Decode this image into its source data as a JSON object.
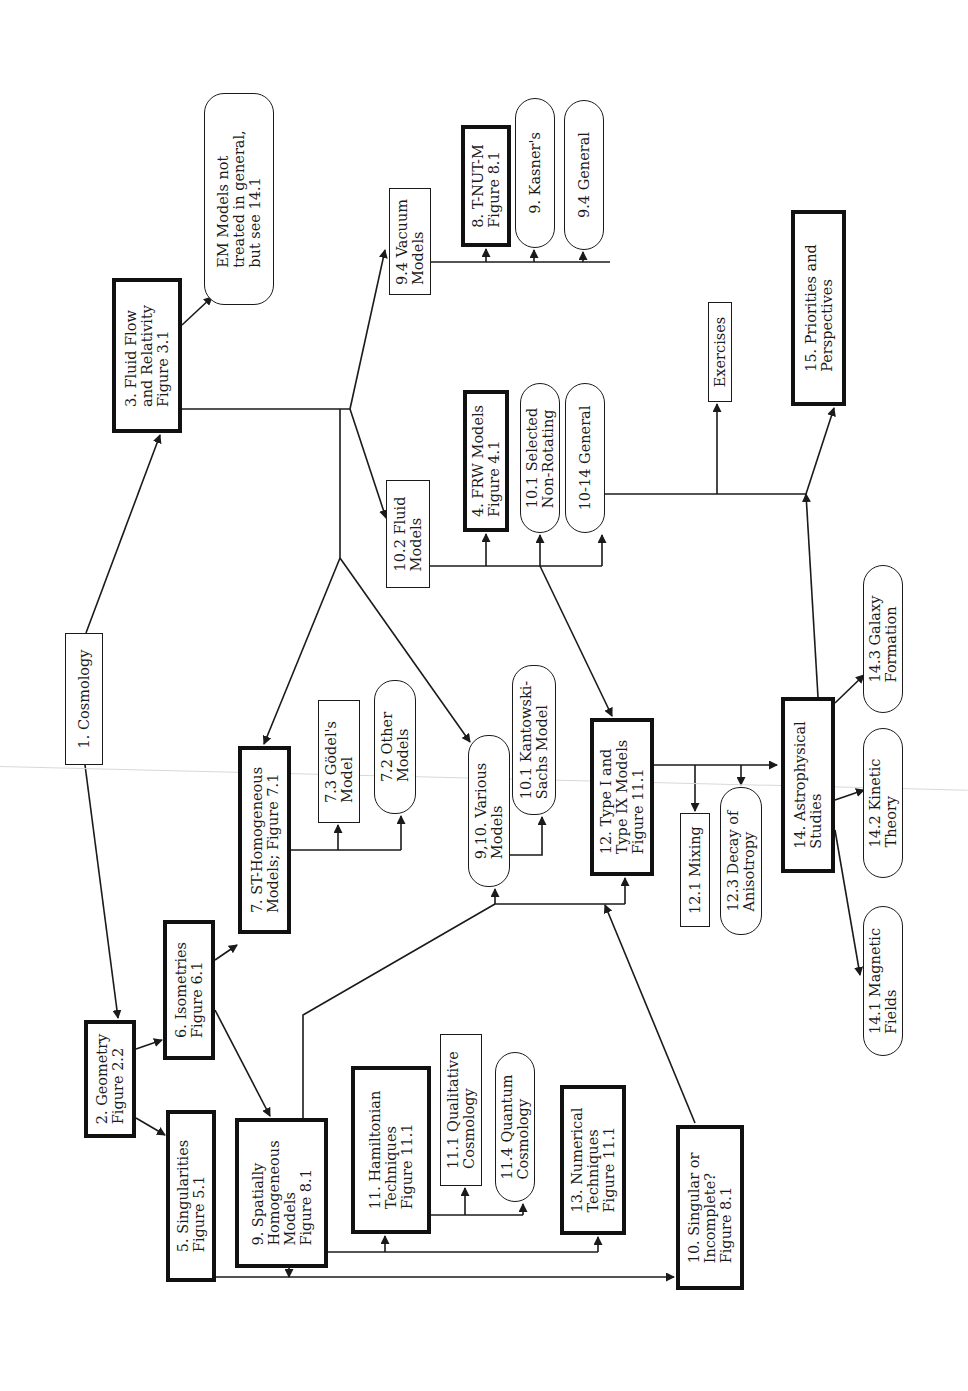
{
  "diagram": {
    "orientation": "rotated -90deg",
    "colors": {
      "ink": "#1a1a1a",
      "background": "#ffffff"
    },
    "nodes": [
      {
        "id": "n1",
        "style": "thin",
        "x": 65,
        "y": 633,
        "w": 38,
        "h": 132,
        "lines": [
          "1.  Cosmology"
        ]
      },
      {
        "id": "n2",
        "style": "thick",
        "x": 84,
        "y": 1020,
        "w": 52,
        "h": 118,
        "lines": [
          "2.  Geometry",
          "Figure 2.2"
        ]
      },
      {
        "id": "n3",
        "style": "thick",
        "x": 112,
        "y": 278,
        "w": 70,
        "h": 155,
        "lines": [
          "3.  Fluid Flow",
          "and Relativity",
          "Figure 3.1"
        ]
      },
      {
        "id": "nEM",
        "style": "rounded",
        "x": 204,
        "y": 93,
        "w": 70,
        "h": 212,
        "lines": [
          "EM Models not",
          "treated in general,",
          "but see 14.1"
        ]
      },
      {
        "id": "n5",
        "style": "thick",
        "x": 166,
        "y": 1110,
        "w": 50,
        "h": 172,
        "lines": [
          "5.  Singularities",
          "Figure 5.1"
        ]
      },
      {
        "id": "n6",
        "style": "thick",
        "x": 163,
        "y": 920,
        "w": 52,
        "h": 140,
        "lines": [
          "6.  Isometries",
          "Figure 6.1"
        ]
      },
      {
        "id": "n7",
        "style": "thick",
        "x": 238,
        "y": 746,
        "w": 53,
        "h": 188,
        "lines": [
          "7.  ST-Homogeneous",
          "Models; Figure 7.1"
        ]
      },
      {
        "id": "n7_3",
        "style": "thin",
        "x": 318,
        "y": 700,
        "w": 42,
        "h": 123,
        "lines": [
          "7.3 Gödel's",
          "Model"
        ]
      },
      {
        "id": "n7_2",
        "style": "rounded",
        "x": 374,
        "y": 680,
        "w": 42,
        "h": 134,
        "lines": [
          "7.2 Other",
          "Models"
        ]
      },
      {
        "id": "n9",
        "style": "thick",
        "x": 235,
        "y": 1118,
        "w": 93,
        "h": 150,
        "lines": [
          "9.  Spatially",
          "Homogeneous",
          "Models",
          "Figure 8.1"
        ]
      },
      {
        "id": "n9_4v",
        "style": "thin",
        "x": 389,
        "y": 188,
        "w": 42,
        "h": 107,
        "lines": [
          "9.4 Vacuum",
          "Models"
        ]
      },
      {
        "id": "n8",
        "style": "thick",
        "x": 461,
        "y": 125,
        "w": 50,
        "h": 122,
        "lines": [
          "8.  T-NUT-M",
          "Figure 8.1"
        ]
      },
      {
        "id": "n9k",
        "style": "rounded",
        "x": 515,
        "y": 98,
        "w": 40,
        "h": 150,
        "lines": [
          "9.  Kasner's"
        ]
      },
      {
        "id": "n9_4g",
        "style": "rounded",
        "x": 564,
        "y": 100,
        "w": 40,
        "h": 150,
        "lines": [
          "9.4 General"
        ]
      },
      {
        "id": "n10_2",
        "style": "thin",
        "x": 386,
        "y": 480,
        "w": 44,
        "h": 108,
        "lines": [
          "10.2 Fluid",
          "Models"
        ]
      },
      {
        "id": "n4",
        "style": "thick",
        "x": 463,
        "y": 390,
        "w": 46,
        "h": 142,
        "lines": [
          "4.  FRW Models",
          "Figure 4.1"
        ]
      },
      {
        "id": "n10_1s",
        "style": "rounded",
        "x": 520,
        "y": 383,
        "w": 40,
        "h": 150,
        "lines": [
          "10.1 Selected",
          "Non-Rotating"
        ]
      },
      {
        "id": "n10_14",
        "style": "rounded",
        "x": 565,
        "y": 383,
        "w": 40,
        "h": 150,
        "lines": [
          "10-14  General"
        ]
      },
      {
        "id": "nEx",
        "style": "thin",
        "x": 708,
        "y": 302,
        "w": 24,
        "h": 100,
        "lines": [
          "Exercises"
        ]
      },
      {
        "id": "n15",
        "style": "thick",
        "x": 791,
        "y": 210,
        "w": 55,
        "h": 196,
        "lines": [
          "15.  Priorities  and",
          "Perspectives"
        ]
      },
      {
        "id": "n9_10",
        "style": "rounded",
        "x": 468,
        "y": 735,
        "w": 42,
        "h": 152,
        "lines": [
          "9,10.  Various",
          "Models"
        ]
      },
      {
        "id": "n10_1k",
        "style": "rounded",
        "x": 512,
        "y": 665,
        "w": 44,
        "h": 150,
        "lines": [
          "10.1 Kantowski-",
          "Sachs Model"
        ]
      },
      {
        "id": "n12",
        "style": "thick",
        "x": 590,
        "y": 718,
        "w": 64,
        "h": 158,
        "lines": [
          "12.  Type I and",
          "Type IX Models",
          "Figure 11.1"
        ]
      },
      {
        "id": "n12_1",
        "style": "thin",
        "x": 680,
        "y": 813,
        "w": 30,
        "h": 114,
        "lines": [
          "12.1 Mixing"
        ]
      },
      {
        "id": "n12_3",
        "style": "rounded",
        "x": 720,
        "y": 787,
        "w": 42,
        "h": 148,
        "lines": [
          "12.3 Decay of",
          "Anisotropy"
        ]
      },
      {
        "id": "n14",
        "style": "thick",
        "x": 781,
        "y": 697,
        "w": 54,
        "h": 176,
        "lines": [
          "14.  Astrophysical",
          "Studies"
        ]
      },
      {
        "id": "n14_3",
        "style": "rounded",
        "x": 863,
        "y": 565,
        "w": 40,
        "h": 148,
        "lines": [
          "14.3 Galaxy",
          "Formation"
        ]
      },
      {
        "id": "n14_2",
        "style": "rounded",
        "x": 863,
        "y": 728,
        "w": 40,
        "h": 150,
        "lines": [
          "14.2 Kinetic",
          "Theory"
        ]
      },
      {
        "id": "n14_1",
        "style": "rounded",
        "x": 863,
        "y": 906,
        "w": 40,
        "h": 150,
        "lines": [
          "14.1 Magnetic",
          "Fields"
        ]
      },
      {
        "id": "n11",
        "style": "thick",
        "x": 351,
        "y": 1066,
        "w": 80,
        "h": 168,
        "lines": [
          "11.  Hamiltonian",
          "Techniques",
          "Figure 11.1"
        ]
      },
      {
        "id": "n11_1",
        "style": "thin",
        "x": 440,
        "y": 1034,
        "w": 42,
        "h": 152,
        "lines": [
          "11.1 Qualitative",
          "Cosmology"
        ]
      },
      {
        "id": "n11_4",
        "style": "rounded",
        "x": 495,
        "y": 1052,
        "w": 40,
        "h": 150,
        "lines": [
          "11.4 Quantum",
          "Cosmology"
        ]
      },
      {
        "id": "n13",
        "style": "thick",
        "x": 560,
        "y": 1085,
        "w": 66,
        "h": 150,
        "lines": [
          "13.  Numerical",
          "Techniques",
          "Figure 11.1"
        ]
      },
      {
        "id": "n10s",
        "style": "thick",
        "x": 676,
        "y": 1125,
        "w": 68,
        "h": 165,
        "lines": [
          "10.  Singular or",
          "Incomplete?",
          "Figure 8.1"
        ]
      }
    ],
    "edges": [
      {
        "points": [
          [
            86,
            633
          ],
          [
            160,
            435
          ]
        ],
        "arrow": true
      },
      {
        "points": [
          [
            85,
            765
          ],
          [
            118,
            1018
          ]
        ],
        "arrow": true
      },
      {
        "points": [
          [
            182,
            325
          ],
          [
            212,
            297
          ]
        ],
        "arrow": true
      },
      {
        "points": [
          [
            182,
            409
          ],
          [
            350,
            409
          ]
        ],
        "arrow": false
      },
      {
        "points": [
          [
            350,
            409
          ],
          [
            385,
            250
          ]
        ],
        "arrow": true
      },
      {
        "points": [
          [
            350,
            409
          ],
          [
            386,
            518
          ]
        ],
        "arrow": true
      },
      {
        "points": [
          [
            340,
            409
          ],
          [
            340,
            558
          ]
        ],
        "arrow": false
      },
      {
        "points": [
          [
            340,
            558
          ],
          [
            264,
            744
          ]
        ],
        "arrow": true
      },
      {
        "points": [
          [
            340,
            558
          ],
          [
            470,
            742
          ]
        ],
        "arrow": true
      },
      {
        "points": [
          [
            431,
            262
          ],
          [
            610,
            262
          ]
        ],
        "arrow": false
      },
      {
        "points": [
          [
            486,
            262
          ],
          [
            486,
            249
          ]
        ],
        "arrow": true
      },
      {
        "points": [
          [
            534,
            262
          ],
          [
            534,
            250
          ]
        ],
        "arrow": true
      },
      {
        "points": [
          [
            583,
            262
          ],
          [
            583,
            252
          ]
        ],
        "arrow": true
      },
      {
        "points": [
          [
            430,
            566
          ],
          [
            602,
            566
          ]
        ],
        "arrow": false
      },
      {
        "points": [
          [
            486,
            566
          ],
          [
            486,
            534
          ]
        ],
        "arrow": true
      },
      {
        "points": [
          [
            540,
            566
          ],
          [
            540,
            535
          ]
        ],
        "arrow": true
      },
      {
        "points": [
          [
            602,
            566
          ],
          [
            602,
            535
          ]
        ],
        "arrow": true
      },
      {
        "points": [
          [
            540,
            566
          ],
          [
            612,
            716
          ]
        ],
        "arrow": true
      },
      {
        "points": [
          [
            605,
            494
          ],
          [
            806,
            494
          ]
        ],
        "arrow": false
      },
      {
        "points": [
          [
            717,
            494
          ],
          [
            717,
            404
          ]
        ],
        "arrow": true
      },
      {
        "points": [
          [
            806,
            494
          ],
          [
            834,
            408
          ]
        ],
        "arrow": true
      },
      {
        "points": [
          [
            818,
            697
          ],
          [
            806,
            494
          ]
        ],
        "arrow": true
      },
      {
        "points": [
          [
            136,
            1049
          ],
          [
            162,
            1040
          ]
        ],
        "arrow": true
      },
      {
        "points": [
          [
            136,
            1118
          ],
          [
            165,
            1135
          ]
        ],
        "arrow": true
      },
      {
        "points": [
          [
            215,
            960
          ],
          [
            237,
            945
          ]
        ],
        "arrow": true
      },
      {
        "points": [
          [
            215,
            1010
          ],
          [
            270,
            1116
          ]
        ],
        "arrow": true
      },
      {
        "points": [
          [
            291,
            850
          ],
          [
            401,
            850
          ]
        ],
        "arrow": false
      },
      {
        "points": [
          [
            338,
            850
          ],
          [
            338,
            825
          ]
        ],
        "arrow": true
      },
      {
        "points": [
          [
            401,
            850
          ],
          [
            401,
            816
          ]
        ],
        "arrow": true
      },
      {
        "points": [
          [
            303,
            1118
          ],
          [
            303,
            1015
          ],
          [
            495,
            904
          ]
        ],
        "arrow": false
      },
      {
        "points": [
          [
            495,
            904
          ],
          [
            495,
            889
          ]
        ],
        "arrow": true
      },
      {
        "points": [
          [
            495,
            904
          ],
          [
            625,
            904
          ]
        ],
        "arrow": false
      },
      {
        "points": [
          [
            625,
            904
          ],
          [
            625,
            878
          ]
        ],
        "arrow": true
      },
      {
        "points": [
          [
            510,
            855
          ],
          [
            542,
            855
          ],
          [
            542,
            817
          ]
        ],
        "arrow": true
      },
      {
        "points": [
          [
            654,
            765
          ],
          [
            777,
            765
          ]
        ],
        "arrow": true
      },
      {
        "points": [
          [
            695,
            765
          ],
          [
            695,
            811
          ]
        ],
        "arrow": true
      },
      {
        "points": [
          [
            741,
            765
          ],
          [
            741,
            785
          ]
        ],
        "arrow": true
      },
      {
        "points": [
          [
            835,
            703
          ],
          [
            864,
            675
          ]
        ],
        "arrow": true
      },
      {
        "points": [
          [
            835,
            800
          ],
          [
            864,
            790
          ]
        ],
        "arrow": true
      },
      {
        "points": [
          [
            835,
            830
          ],
          [
            860,
            975
          ]
        ],
        "arrow": true
      },
      {
        "points": [
          [
            328,
            1252
          ],
          [
            598,
            1252
          ]
        ],
        "arrow": false
      },
      {
        "points": [
          [
            385,
            1252
          ],
          [
            385,
            1236
          ]
        ],
        "arrow": true
      },
      {
        "points": [
          [
            598,
            1252
          ],
          [
            598,
            1237
          ]
        ],
        "arrow": true
      },
      {
        "points": [
          [
            431,
            1215
          ],
          [
            523,
            1215
          ]
        ],
        "arrow": false
      },
      {
        "points": [
          [
            465,
            1215
          ],
          [
            465,
            1188
          ]
        ],
        "arrow": true
      },
      {
        "points": [
          [
            523,
            1215
          ],
          [
            523,
            1204
          ]
        ],
        "arrow": true
      },
      {
        "points": [
          [
            216,
            1277
          ],
          [
            674,
            1277
          ]
        ],
        "arrow": true
      },
      {
        "points": [
          [
            289,
            1268
          ],
          [
            289,
            1277
          ]
        ],
        "arrow": true
      },
      {
        "points": [
          [
            695,
            1123
          ],
          [
            605,
            905
          ]
        ],
        "arrow": true
      }
    ]
  }
}
